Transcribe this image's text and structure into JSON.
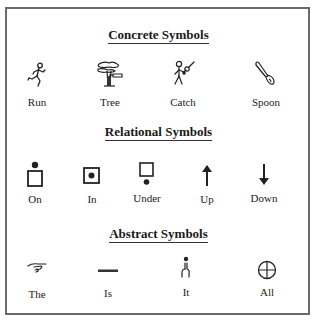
{
  "sections": [
    {
      "title": "Concrete Symbols",
      "items": [
        {
          "label": "Run",
          "icon": "running-figure-icon"
        },
        {
          "label": "Tree",
          "icon": "tree-icon"
        },
        {
          "label": "Catch",
          "icon": "catching-figure-icon"
        },
        {
          "label": "Spoon",
          "icon": "spoon-icon"
        }
      ]
    },
    {
      "title": "Relational Symbols",
      "items": [
        {
          "label": "On",
          "icon": "dot-on-box-icon"
        },
        {
          "label": "In",
          "icon": "dot-in-box-icon"
        },
        {
          "label": "Under",
          "icon": "dot-under-box-icon"
        },
        {
          "label": "Up",
          "icon": "arrow-up-icon"
        },
        {
          "label": "Down",
          "icon": "arrow-down-icon"
        }
      ]
    },
    {
      "title": "Abstract Symbols",
      "items": [
        {
          "label": "The",
          "icon": "pointing-hand-icon"
        },
        {
          "label": "Is",
          "icon": "horizontal-bar-icon"
        },
        {
          "label": "It",
          "icon": "pointing-finger-dot-icon"
        },
        {
          "label": "All",
          "icon": "circle-cross-icon"
        }
      ]
    }
  ],
  "colors": {
    "frame": "#6a6a6a",
    "ink": "#1a1a1a",
    "background": "#ffffff"
  }
}
